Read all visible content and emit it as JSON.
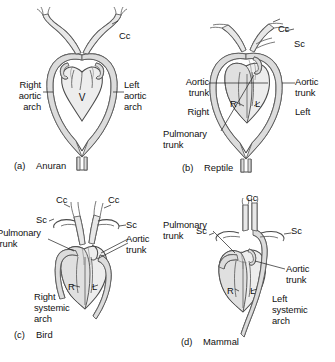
{
  "figure": {
    "background_color": "#ffffff",
    "ink_color": "#111111",
    "vessel_stroke_color": "#4a4a4a",
    "vessel_fill_color": "#dcdcdc",
    "heart_fill_color": "#ededed"
  },
  "panels": [
    {
      "id": "a",
      "caption_letter": "(a)",
      "caption_name": "Anuran",
      "labels": [
        {
          "name": "common-carotid",
          "text": "Cc",
          "lines": [
            "Cc"
          ]
        },
        {
          "name": "right-aortic-arch",
          "text": "Right aortic arch",
          "lines": [
            "Right",
            "aortic",
            "arch"
          ]
        },
        {
          "name": "left-aortic-arch",
          "text": "Left aortic arch",
          "lines": [
            "Left",
            "aortic",
            "arch"
          ]
        },
        {
          "name": "ventricle",
          "text": "V",
          "lines": [
            "V"
          ]
        }
      ]
    },
    {
      "id": "b",
      "caption_letter": "(b)",
      "caption_name": "Reptile",
      "labels": [
        {
          "name": "common-carotid",
          "text": "Cc",
          "lines": [
            "Cc"
          ]
        },
        {
          "name": "subclavian",
          "text": "Sc",
          "lines": [
            "Sc"
          ]
        },
        {
          "name": "aortic-trunk-left",
          "text": "Aortic trunk",
          "lines": [
            "Aortic",
            "trunk"
          ]
        },
        {
          "name": "aortic-trunk-right",
          "text": "Aortic trunk",
          "lines": [
            "Aortic",
            "trunk"
          ]
        },
        {
          "name": "right-side",
          "text": "Right",
          "lines": [
            "Right"
          ]
        },
        {
          "name": "left-side",
          "text": "Left",
          "lines": [
            "Left"
          ]
        },
        {
          "name": "pulmonary-trunk",
          "text": "Pulmonary trunk",
          "lines": [
            "Pulmonary",
            "trunk"
          ]
        },
        {
          "name": "right-ventricle",
          "text": "R",
          "lines": [
            "R"
          ]
        },
        {
          "name": "left-ventricle",
          "text": "L",
          "lines": [
            "L"
          ]
        }
      ]
    },
    {
      "id": "c",
      "caption_letter": "(c)",
      "caption_name": "Bird",
      "labels": [
        {
          "name": "common-carotid-left",
          "text": "Cc",
          "lines": [
            "Cc"
          ]
        },
        {
          "name": "common-carotid-right",
          "text": "Cc",
          "lines": [
            "Cc"
          ]
        },
        {
          "name": "subclavian-left",
          "text": "Sc",
          "lines": [
            "Sc"
          ]
        },
        {
          "name": "subclavian-right",
          "text": "Sc",
          "lines": [
            "Sc"
          ]
        },
        {
          "name": "pulmonary-trunk",
          "text": "Pulmonary trunk",
          "lines": [
            "Pulmonary",
            "trunk"
          ]
        },
        {
          "name": "aortic-trunk",
          "text": "Aortic trunk",
          "lines": [
            "Aortic",
            "trunk"
          ]
        },
        {
          "name": "right-systemic-arch",
          "text": "Right systemic arch",
          "lines": [
            "Right",
            "systemic",
            "arch"
          ]
        },
        {
          "name": "right-ventricle",
          "text": "R",
          "lines": [
            "R"
          ]
        },
        {
          "name": "left-ventricle",
          "text": "L",
          "lines": [
            "L"
          ]
        }
      ]
    },
    {
      "id": "d",
      "caption_letter": "(d)",
      "caption_name": "Mammal",
      "labels": [
        {
          "name": "common-carotid",
          "text": "Cc",
          "lines": [
            "Cc"
          ]
        },
        {
          "name": "subclavian-left",
          "text": "Sc",
          "lines": [
            "Sc"
          ]
        },
        {
          "name": "subclavian-right",
          "text": "Sc",
          "lines": [
            "Sc"
          ]
        },
        {
          "name": "pulmonary-trunk",
          "text": "Pulmonary trunk",
          "lines": [
            "Pulmonary",
            "trunk"
          ]
        },
        {
          "name": "aortic-trunk",
          "text": "Aortic trunk",
          "lines": [
            "Aortic",
            "trunk"
          ]
        },
        {
          "name": "left-systemic-arch",
          "text": "Left systemic arch",
          "lines": [
            "Left",
            "systemic",
            "arch"
          ]
        },
        {
          "name": "right-ventricle",
          "text": "R",
          "lines": [
            "R"
          ]
        },
        {
          "name": "left-ventricle",
          "text": "L",
          "lines": [
            "L"
          ]
        }
      ]
    }
  ],
  "panel_a": {
    "cc": "Cc",
    "right_l1": "Right",
    "right_l2": "aortic",
    "right_l3": "arch",
    "left_l1": "Left",
    "left_l2": "aortic",
    "left_l3": "arch",
    "ventricle": "V",
    "cap_letter": "(a)",
    "cap_name": "Anuran"
  },
  "panel_b": {
    "cc": "Cc",
    "sc": "Sc",
    "aortic_l1": "Aortic",
    "aortic_l2": "trunk",
    "aortic_r1": "Aortic",
    "aortic_r2": "trunk",
    "right": "Right",
    "left": "Left",
    "pulm_l1": "Pulmonary",
    "pulm_l2": "trunk",
    "r": "R",
    "l": "L",
    "cap_letter": "(b)",
    "cap_name": "Reptile"
  },
  "panel_c": {
    "cc_left": "Cc",
    "cc_right": "Cc",
    "sc_left": "Sc",
    "sc_right": "Sc",
    "pulm_l1": "Pulmonary",
    "pulm_l2": "trunk",
    "aortic_l1": "Aortic",
    "aortic_l2": "trunk",
    "sys_l1": "Right",
    "sys_l2": "systemic",
    "sys_l3": "arch",
    "r": "R",
    "l": "L",
    "cap_letter": "(c)",
    "cap_name": "Bird"
  },
  "panel_d": {
    "cc": "Cc",
    "sc_left": "Sc",
    "sc_right": "Sc",
    "pulm_l1": "Pulmonary",
    "pulm_l2": "trunk",
    "aortic_l1": "Aortic",
    "aortic_l2": "trunk",
    "sys_l1": "Left",
    "sys_l2": "systemic",
    "sys_l3": "arch",
    "r": "R",
    "l": "L",
    "cap_letter": "(d)",
    "cap_name": "Mammal"
  }
}
